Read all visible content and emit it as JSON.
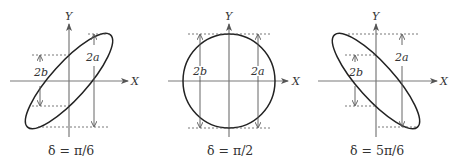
{
  "figure": {
    "panels": [
      {
        "id": "pi6",
        "caption": "δ = π/6",
        "x_axis_label": "X",
        "y_axis_label": "Y",
        "major_label": "2a",
        "minor_label": "2b",
        "shape": "ellipse tilted right (positive slope)"
      },
      {
        "id": "pi2",
        "caption": "δ = π/2",
        "x_axis_label": "X",
        "y_axis_label": "Y",
        "major_label": "2a",
        "minor_label": "2b",
        "shape": "circle"
      },
      {
        "id": "5pi6",
        "caption": "δ = 5π/6",
        "x_axis_label": "X",
        "y_axis_label": "Y",
        "major_label": "2a",
        "minor_label": "2b",
        "shape": "ellipse tilted left (negative slope)"
      }
    ]
  }
}
